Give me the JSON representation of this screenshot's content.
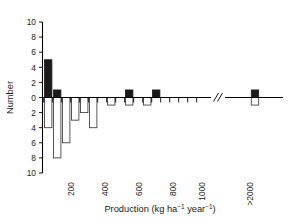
{
  "chart_data": {
    "type": "bar",
    "title": "",
    "subtitle": "",
    "xlabel": "Production (kg ha−1 year−1)",
    "ylabel": "Number",
    "grid": false,
    "legend": null,
    "orientation": "vertical",
    "note": "Back-to-back histogram: filled black bars extend upward (positive Number), open white bars extend downward (negative Number). X axis has a break between 1000 and >2000.",
    "ylim": [
      -10,
      10
    ],
    "y_ticks": [
      10,
      8,
      6,
      4,
      2,
      0,
      2,
      4,
      6,
      8,
      10
    ],
    "y_tick_labels": [
      "10",
      "8",
      "6",
      "4",
      "2",
      "0",
      "2",
      "4",
      "6",
      "8",
      "10"
    ],
    "x_tick_labels": [
      "200",
      "400",
      "600",
      "800",
      "1000",
      ">2000"
    ],
    "x_tick_values": [
      200,
      400,
      600,
      800,
      1000,
      2000
    ],
    "x_axis_break": true,
    "x_axis_break_label": "//",
    "bin_width": 50,
    "categories": [
      "0-50",
      "50-100",
      "100-150",
      "150-200",
      "200-250",
      "250-300",
      "300-350",
      "350-400",
      "400-450",
      "450-500",
      "500-550",
      "550-600",
      "600-650",
      "650-700",
      "700-750",
      "750-800",
      "800-850",
      "850-900",
      "900-950",
      "950-1000",
      ">2000"
    ],
    "series": [
      {
        "name": "Positive (filled)",
        "color": "#1a1a1a",
        "fill": "solid",
        "values": [
          5,
          1,
          0,
          0,
          0,
          0,
          0,
          0,
          0,
          1,
          0,
          0,
          1,
          0,
          0,
          0,
          0,
          0,
          0,
          0,
          1
        ]
      },
      {
        "name": "Negative (open)",
        "color": "#ffffff",
        "fill": "open",
        "values": [
          -4,
          -8,
          -6,
          -3,
          -2,
          -4,
          0,
          -1,
          0,
          -1,
          0,
          -1,
          0,
          0,
          0,
          0,
          0,
          0,
          0,
          0,
          -1
        ]
      }
    ]
  },
  "axis": {
    "y_title": "Number",
    "x_title_prefix": "Production (kg ha",
    "x_title_sup1": "−1",
    "x_title_mid": " year",
    "x_title_sup2": "−1",
    "x_title_suffix": ")"
  }
}
